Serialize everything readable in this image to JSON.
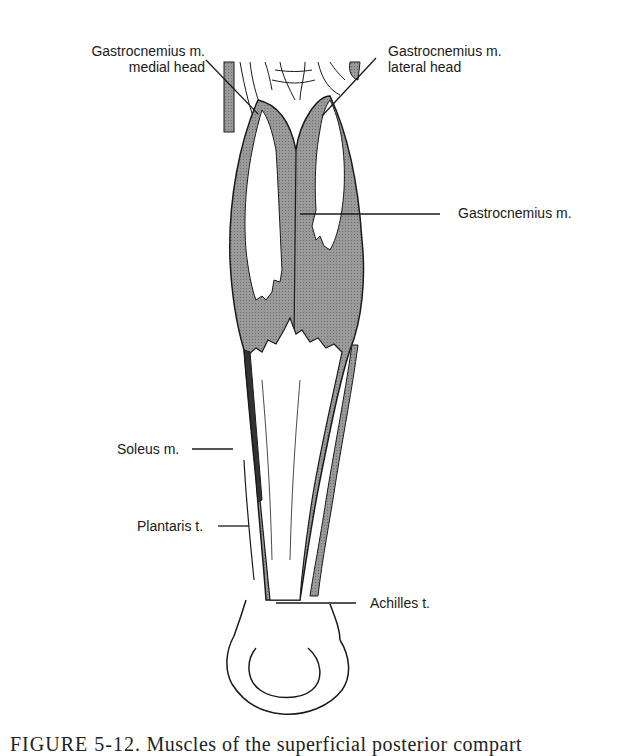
{
  "figure": {
    "labels": {
      "gastroc_medial_line1": "Gastrocnemius m.",
      "gastroc_medial_line2": "medial head",
      "gastroc_lateral_line1": "Gastrocnemius m.",
      "gastroc_lateral_line2": "lateral head",
      "gastrocnemius": "Gastrocnemius m.",
      "soleus": "Soleus m.",
      "plantaris": "Plantaris t.",
      "achilles": "Achilles t."
    },
    "caption": {
      "figure_number": "FIGURE 5-12.",
      "text": "Muscles of the superficial posterior compart"
    },
    "colors": {
      "muscle_fill": "#8c8c8c",
      "outline": "#1a1a1a",
      "tendon_fill": "#ffffff",
      "background": "#ffffff"
    }
  }
}
